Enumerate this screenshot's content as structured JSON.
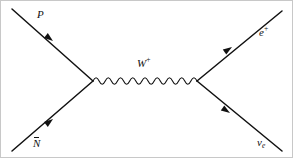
{
  "figure": {
    "kind": "feynman-diagram",
    "title": "",
    "background_color": "#ffffff",
    "border_color": "#c8c8c8",
    "line_color": "#111111",
    "text_color": "#111111"
  },
  "labels": {
    "incoming_top": "P",
    "incoming_bottom_base": "N",
    "incoming_bottom_full": "N̄",
    "propagator_base": "W",
    "propagator_charge": "+",
    "outgoing_top_base": "e",
    "outgoing_top_charge": "+",
    "outgoing_bottom_base": "ν",
    "outgoing_bottom_subscript": "e"
  },
  "geometry": {
    "vertex_left": {
      "x": 92,
      "y": 80
    },
    "vertex_right": {
      "x": 196,
      "y": 80
    },
    "incoming_top_start": {
      "x": 11,
      "y": 8
    },
    "incoming_bottom_start": {
      "x": 11,
      "y": 150
    },
    "outgoing_top_end": {
      "x": 281,
      "y": 10
    },
    "outgoing_bottom_end": {
      "x": 281,
      "y": 150
    },
    "wave_amplitude": 3.2,
    "wave_period": 6.2
  },
  "arrows": [
    {
      "name": "arrow-incoming-top",
      "x": 52,
      "y": 40,
      "angle": 38,
      "direction": "toward-vertex"
    },
    {
      "name": "arrow-incoming-bottom",
      "x": 52,
      "y": 118,
      "angle": -38,
      "direction": "toward-vertex"
    },
    {
      "name": "arrow-outgoing-top",
      "x": 231,
      "y": 46,
      "angle": -34,
      "direction": "away-from-vertex"
    },
    {
      "name": "arrow-outgoing-bottom",
      "x": 229,
      "y": 112,
      "angle": 34,
      "direction": "away-from-vertex"
    }
  ]
}
